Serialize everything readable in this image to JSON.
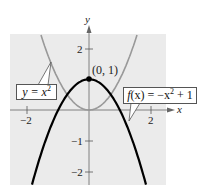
{
  "chart_data": {
    "type": "line",
    "title": "",
    "xlabel": "x",
    "ylabel": "y",
    "xlim": [
      -2.55,
      2.5
    ],
    "ylim": [
      -2.45,
      2.5
    ],
    "grid": false,
    "background": "#ebebeb",
    "x_ticks": [
      -2,
      2
    ],
    "x_tick_labels": [
      "−2",
      "2"
    ],
    "y_ticks": [
      -2,
      -1,
      2
    ],
    "y_tick_labels": [
      "−2",
      "−1",
      "2"
    ],
    "series": [
      {
        "name": "y = x^2",
        "label_text": "y = x²",
        "function": "x^2",
        "color": "#999999",
        "x": [
          -1.6,
          -1.2,
          -0.8,
          -0.4,
          0,
          0.4,
          0.8,
          1.2,
          1.6
        ],
        "values": [
          2.56,
          1.44,
          0.64,
          0.16,
          0,
          0.16,
          0.64,
          1.44,
          2.56
        ]
      },
      {
        "name": "f(x) = -x^2 + 1",
        "label_text": "f(x) = −x² + 1",
        "function": "-x^2+1",
        "color": "#000000",
        "x": [
          -1.85,
          -1.5,
          -1,
          -0.5,
          0,
          0.5,
          1,
          1.5,
          1.85
        ],
        "values": [
          -2.42,
          -1.25,
          0,
          0.75,
          1,
          0.75,
          0,
          -1.25,
          -2.42
        ]
      }
    ],
    "annotations": [
      {
        "text": "(0, 1)",
        "x": 0,
        "y": 1,
        "marker": "filled-circle"
      }
    ]
  },
  "labels": {
    "x_axis": "x",
    "y_axis": "y",
    "point": "(0, 1)",
    "tick_x_neg2": "−2",
    "tick_x_2": "2",
    "tick_y_2": "2",
    "tick_y_neg1": "−1",
    "tick_y_neg2": "−2",
    "callout_left": {
      "pre": "y = x",
      "sup": "2"
    },
    "callout_right": {
      "fx": "f",
      "arg": "(x)",
      "mid": " = −x",
      "sup": "2",
      "post": " + 1"
    }
  }
}
